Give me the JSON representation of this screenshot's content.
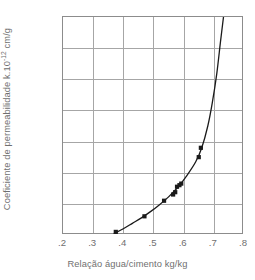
{
  "chart_data": {
    "type": "scatter",
    "title": "",
    "xlabel": "Relação água/cimento kg/kg",
    "ylabel": "Coeficiente de permeabilidade k.10-12 cm/g",
    "ylabel_prefix": "Coeficiente de permeabilidade k.10",
    "ylabel_exponent": "-12",
    "ylabel_suffix": " cm/g",
    "xlim": [
      0.2,
      0.8
    ],
    "ylim": [
      0,
      140
    ],
    "xticks": [
      ".2",
      ".3",
      ".4",
      ".5",
      ".6",
      ".7",
      ".8"
    ],
    "xtick_values": [
      0.2,
      0.3,
      0.4,
      0.5,
      0.6,
      0.7,
      0.8
    ],
    "yticks": [
      "20",
      "40",
      "60",
      "80",
      "100",
      "120",
      "140"
    ],
    "ytick_values": [
      20,
      40,
      60,
      80,
      100,
      120,
      140
    ],
    "grid": true,
    "legend": "none",
    "marker": "filled-square",
    "marker_color": "#1a1a1a",
    "line_color": "#1a1a1a",
    "grid_color": "#a6a6a6",
    "frame_color": "#8c8c8c",
    "x": [
      0.375,
      0.47,
      0.535,
      0.565,
      0.572,
      0.578,
      0.586,
      0.592,
      0.65,
      0.657
    ],
    "y": [
      2,
      12,
      22,
      26,
      27.5,
      31,
      32,
      33,
      50,
      56
    ],
    "points": [
      {
        "x": 0.375,
        "y": 2
      },
      {
        "x": 0.47,
        "y": 12
      },
      {
        "x": 0.535,
        "y": 22
      },
      {
        "x": 0.565,
        "y": 26
      },
      {
        "x": 0.572,
        "y": 27.5
      },
      {
        "x": 0.578,
        "y": 31
      },
      {
        "x": 0.586,
        "y": 32
      },
      {
        "x": 0.592,
        "y": 33
      },
      {
        "x": 0.65,
        "y": 50
      },
      {
        "x": 0.657,
        "y": 56
      }
    ],
    "fit_curve": [
      {
        "x": 0.37,
        "y": 1
      },
      {
        "x": 0.4,
        "y": 4
      },
      {
        "x": 0.43,
        "y": 7.5
      },
      {
        "x": 0.46,
        "y": 11
      },
      {
        "x": 0.49,
        "y": 15
      },
      {
        "x": 0.52,
        "y": 19.5
      },
      {
        "x": 0.55,
        "y": 24.5
      },
      {
        "x": 0.58,
        "y": 30.5
      },
      {
        "x": 0.61,
        "y": 38
      },
      {
        "x": 0.64,
        "y": 47
      },
      {
        "x": 0.66,
        "y": 56
      },
      {
        "x": 0.68,
        "y": 70
      },
      {
        "x": 0.695,
        "y": 85
      },
      {
        "x": 0.71,
        "y": 104
      },
      {
        "x": 0.722,
        "y": 124
      },
      {
        "x": 0.732,
        "y": 140
      }
    ]
  }
}
